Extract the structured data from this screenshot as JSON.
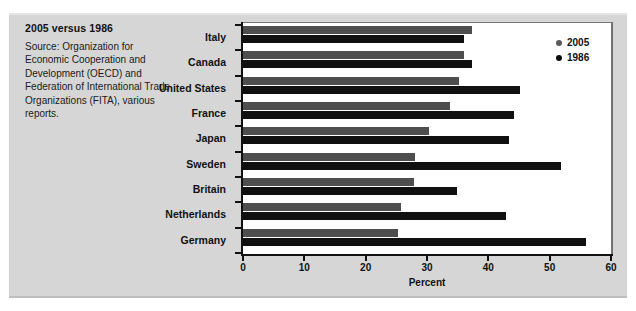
{
  "caption": {
    "title": "2005 versus 1986",
    "source": "Source: Organization for Economic Cooperation and Development (OECD) and Federation of International Trade Organizations (FITA), various reports."
  },
  "legend": {
    "items": [
      {
        "label": "2005",
        "color": "#5a5a5a"
      },
      {
        "label": "1986",
        "color": "#0d0d0d"
      }
    ]
  },
  "axis": {
    "x_title": "Percent",
    "x_ticks": [
      "0",
      "10",
      "20",
      "30",
      "40",
      "50",
      "60"
    ]
  },
  "chart_data": {
    "type": "bar",
    "orientation": "horizontal",
    "title": "2005 versus 1986",
    "xlabel": "Percent",
    "ylabel": "",
    "xlim": [
      0,
      60
    ],
    "xticks": [
      0,
      10,
      20,
      30,
      40,
      50,
      60
    ],
    "grid": false,
    "legend_position": "top-right",
    "categories": [
      "Italy",
      "Canada",
      "United States",
      "France",
      "Japan",
      "Sweden",
      "Britain",
      "Netherlands",
      "Germany"
    ],
    "series": [
      {
        "name": "2005",
        "color": "#4e4e4e",
        "values": [
          37.4,
          36.0,
          35.2,
          33.7,
          30.3,
          28.0,
          27.9,
          25.7,
          25.2
        ]
      },
      {
        "name": "1986",
        "color": "#101010",
        "values": [
          36.0,
          37.4,
          45.2,
          44.2,
          43.4,
          51.8,
          34.9,
          42.8,
          56.0
        ]
      }
    ],
    "annotations": [
      "Source: Organization for Economic Cooperation and Development (OECD) and Federation of International Trade Organizations (FITA), various reports."
    ]
  }
}
